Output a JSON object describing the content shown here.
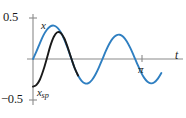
{
  "chart_data": {
    "type": "line",
    "title": "",
    "xlabel": "t",
    "ylabel": "",
    "grid": false,
    "legend_position": "inline-annotation",
    "xlim": [
      0,
      3.72
    ],
    "ylim": [
      -0.5,
      0.5
    ],
    "y_ticks": [
      0.5,
      -0.5
    ],
    "y_tick_labels": [
      "0.5",
      "-0.5"
    ],
    "x_ticks": [
      3.1416
    ],
    "x_tick_labels": [
      "π"
    ],
    "annotations": [
      {
        "text": "x",
        "x": 0.45,
        "y": 0.46,
        "series": "x",
        "style": "italic"
      },
      {
        "text": "xsp",
        "x": 0.18,
        "y": -0.37,
        "series": "xsp",
        "style": "italic-subscript"
      },
      {
        "text": "t",
        "x": 3.66,
        "y": 0.06,
        "series": "axis",
        "style": "italic"
      }
    ],
    "series": [
      {
        "name": "x",
        "color": "#2f7fc1",
        "description": "full solution: transient plus steady periodic",
        "x": [
          0.0,
          0.1,
          0.2,
          0.3,
          0.4,
          0.5,
          0.6,
          0.7,
          0.8,
          0.9,
          1.0,
          1.1,
          1.2,
          1.3,
          1.4,
          1.5,
          1.6,
          1.7,
          1.8,
          1.9,
          2.0,
          2.1,
          2.2,
          2.3,
          2.4,
          2.5,
          2.6,
          2.7,
          2.8,
          2.9,
          3.0,
          3.1,
          3.2,
          3.3,
          3.4,
          3.5,
          3.6,
          3.7
        ],
        "y": [
          0.0,
          0.092,
          0.195,
          0.288,
          0.357,
          0.398,
          0.407,
          0.383,
          0.327,
          0.24,
          0.131,
          0.01,
          -0.11,
          -0.202,
          -0.268,
          -0.298,
          -0.294,
          -0.256,
          -0.189,
          -0.101,
          -0.003,
          0.099,
          0.186,
          0.251,
          0.289,
          0.296,
          0.271,
          0.217,
          0.139,
          0.045,
          -0.055,
          -0.15,
          -0.227,
          -0.277,
          -0.297,
          -0.284,
          -0.24,
          -0.172
        ]
      },
      {
        "name": "xsp",
        "color": "#1a1a1a",
        "description": "steady periodic solution",
        "x": [
          0.0,
          0.1,
          0.2,
          0.3,
          0.4,
          0.5,
          0.6,
          0.7,
          0.8,
          0.9,
          1.0,
          1.1,
          1.2,
          1.3
        ],
        "y": [
          -0.337,
          -0.316,
          -0.25,
          -0.135,
          0.01,
          0.16,
          0.272,
          0.326,
          0.318,
          0.253,
          0.142,
          0.012,
          -0.11,
          -0.202
        ]
      }
    ]
  },
  "labels": {
    "y_top": "0.5",
    "y_bottom": "−0.5",
    "curve_x": "x",
    "curve_xsp_base": "x",
    "curve_xsp_sub": "sp",
    "x_tick_pi": "π",
    "axis_t": "t"
  },
  "colors": {
    "curve_x": "#2f7fc1",
    "curve_xsp": "#1a1a1a",
    "axis": "#8a8a8a",
    "background": "#ffffff",
    "text": "#1a1a1a"
  }
}
